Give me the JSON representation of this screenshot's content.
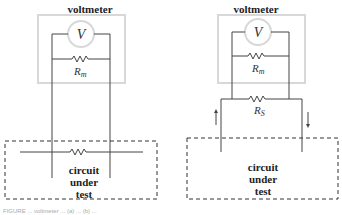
{
  "figure": {
    "left_panel": {
      "title": "voltmeter",
      "meter_symbol": "V",
      "resistor_label": "R",
      "resistor_subscript": "m",
      "circuit_label_lines": [
        "circuit",
        "under",
        "test"
      ]
    },
    "right_panel": {
      "title": "voltmeter",
      "meter_symbol": "V",
      "resistor_label": "R",
      "resistor_subscript": "m",
      "shunt_label": "R",
      "shunt_subscript": "S",
      "circuit_label_lines": [
        "circuit",
        "under",
        "test"
      ],
      "arrows": [
        "up-arrow",
        "down-arrow"
      ]
    },
    "caption": "FIGURE ... voltmeter ... (a) ... (b) ..."
  },
  "colors": {
    "wire": "#444444",
    "voltmeter_box": "#d8d8d8",
    "dashed_box": "#333333"
  }
}
